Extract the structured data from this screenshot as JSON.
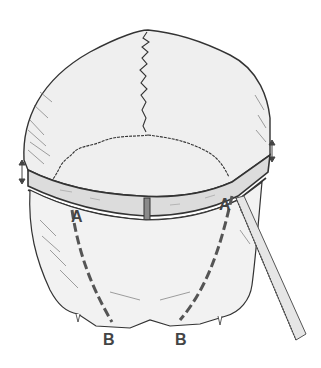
{
  "figure": {
    "labels": {
      "a_left": "A",
      "a_right": "A",
      "b_left": "B",
      "b_right": "B"
    },
    "colors": {
      "background": "#ffffff",
      "bone_fill": "#efefef",
      "band_fill": "#dcdcdc",
      "outline": "#333333",
      "cut_line": "#555555",
      "saw_fill": "#e6e6e6"
    }
  }
}
